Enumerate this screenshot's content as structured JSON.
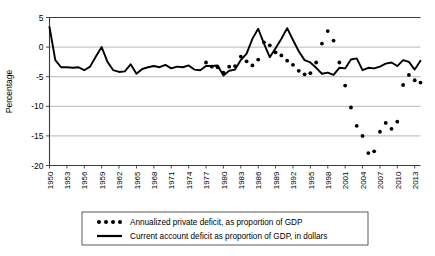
{
  "chart_data": {
    "type": "line",
    "title": "",
    "xlabel": "",
    "ylabel": "Percentage",
    "ylim": [
      -20,
      5
    ],
    "xlim": [
      1950,
      2014
    ],
    "grid": true,
    "yticks": [
      5,
      0,
      -5,
      -10,
      -15,
      -20
    ],
    "ytick_labels": [
      "5",
      "0",
      "-5",
      "-10",
      "-15",
      "-20"
    ],
    "xticks": [
      1950,
      1953,
      1956,
      1959,
      1962,
      1965,
      1968,
      1971,
      1974,
      1977,
      1980,
      1983,
      1986,
      1989,
      1992,
      1995,
      1998,
      2001,
      2004,
      2007,
      2010,
      2013
    ],
    "xtick_labels": [
      "1950",
      "1953",
      "1956",
      "1959",
      "1962",
      "1965",
      "1968",
      "1971",
      "1974",
      "1977",
      "1980",
      "1983",
      "1986",
      "1989",
      "1992",
      "1995",
      "1998",
      "2001",
      "2004",
      "2007",
      "2010",
      "2013"
    ],
    "legend_position": "below",
    "series": [
      {
        "name": "Annualized private deficit, as proportion of GDP",
        "style": "dotted",
        "marker": "circle",
        "color": "#000000",
        "x": [
          1977,
          1978,
          1979,
          1980,
          1981,
          1982,
          1983,
          1984,
          1985,
          1986,
          1987,
          1988,
          1989,
          1990,
          1991,
          1992,
          1993,
          1994,
          1995,
          1996,
          1997,
          1998,
          1999,
          2000,
          2001,
          2002,
          2003,
          2004,
          2005,
          2006,
          2007,
          2008,
          2009,
          2010,
          2011,
          2012,
          2013,
          2014
        ],
        "values": [
          -2.6,
          -3.3,
          -3.4,
          -4.3,
          -3.3,
          -3.2,
          -1.6,
          -2.4,
          -3.1,
          -2.1,
          0.8,
          0.3,
          -0.9,
          -1.4,
          -2.3,
          -3.0,
          -4.0,
          -4.6,
          -4.4,
          -2.6,
          0.6,
          2.7,
          1.1,
          -2.6,
          -6.5,
          -10.2,
          -13.3,
          -15.0,
          -17.9,
          -17.6,
          -14.3,
          -12.8,
          -13.8,
          -12.6,
          -6.4,
          -4.7,
          -5.6,
          -6.0
        ]
      },
      {
        "name": "Current account deficit as proportion of GDP, in dollars",
        "style": "solid",
        "color": "#000000",
        "x": [
          1950,
          1951,
          1952,
          1953,
          1954,
          1955,
          1956,
          1957,
          1958,
          1959,
          1960,
          1961,
          1962,
          1963,
          1964,
          1965,
          1966,
          1967,
          1968,
          1969,
          1970,
          1971,
          1972,
          1973,
          1974,
          1975,
          1976,
          1977,
          1978,
          1979,
          1980,
          1981,
          1982,
          1983,
          1984,
          1985,
          1986,
          1987,
          1988,
          1989,
          1990,
          1991,
          1992,
          1993,
          1994,
          1995,
          1996,
          1997,
          1998,
          1999,
          2000,
          2001,
          2002,
          2003,
          2004,
          2005,
          2006,
          2007,
          2008,
          2009,
          2010,
          2011,
          2012,
          2013,
          2014
        ],
        "values": [
          3.4,
          -2.2,
          -3.4,
          -3.4,
          -3.5,
          -3.4,
          -3.9,
          -3.3,
          -1.6,
          0.0,
          -2.5,
          -3.9,
          -4.2,
          -4.1,
          -2.9,
          -4.5,
          -3.7,
          -3.4,
          -3.2,
          -3.4,
          -3.0,
          -3.6,
          -3.3,
          -3.4,
          -3.1,
          -3.8,
          -3.9,
          -3.2,
          -3.2,
          -3.1,
          -4.8,
          -4.0,
          -3.8,
          -2.2,
          -1.1,
          1.4,
          3.1,
          0.6,
          -1.7,
          -0.2,
          1.4,
          3.2,
          1.2,
          -0.7,
          -2.2,
          -2.6,
          -3.5,
          -4.5,
          -4.3,
          -4.7,
          -3.5,
          -3.6,
          -2.1,
          -1.9,
          -3.9,
          -3.5,
          -3.6,
          -3.3,
          -2.8,
          -2.6,
          -3.2,
          -2.2,
          -2.5,
          -3.8,
          -2.3
        ]
      }
    ]
  },
  "legend": {
    "items": [
      {
        "label": "Annualized private deficit, as proportion of GDP",
        "marker": "dotted-marker"
      },
      {
        "label": "Current account deficit as proportion of GDP, in dollars",
        "marker": "solid-line-marker"
      }
    ]
  },
  "axes": {
    "y_title": "Percentage"
  }
}
